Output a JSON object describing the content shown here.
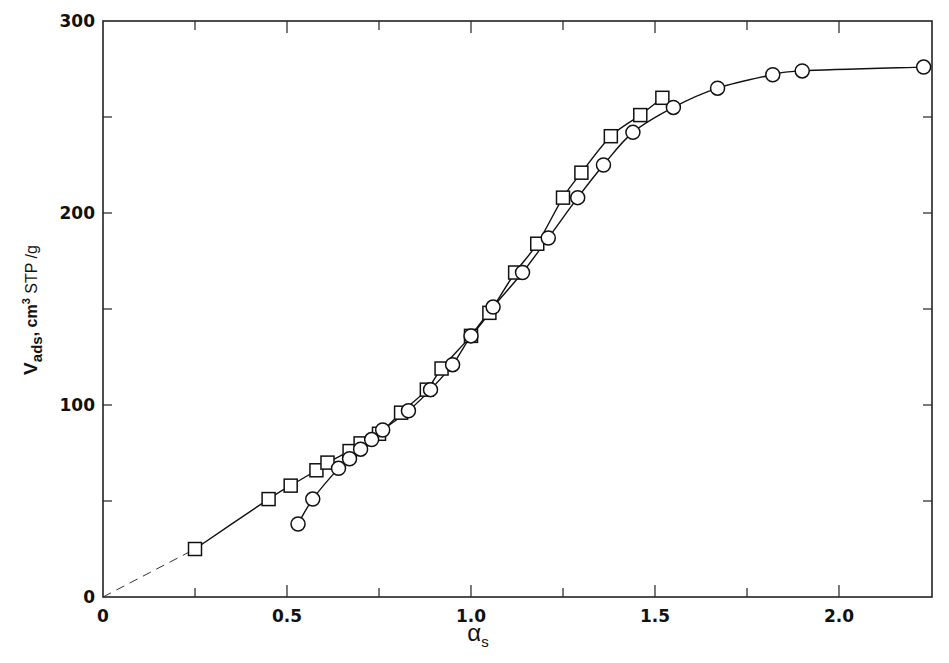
{
  "chart_data": {
    "type": "line",
    "title": "",
    "xlabel": "α",
    "xlabel_subscript": "s",
    "ylabel_main": "V",
    "ylabel_subscript": "ads",
    "ylabel_units_prefix": ",  cm",
    "ylabel_units_sup": "3",
    "ylabel_units_suffix": " STP /g",
    "xlim": [
      0,
      2.24
    ],
    "ylim": [
      0,
      300
    ],
    "grid": false,
    "legend": null,
    "x_ticks": [
      {
        "value": 0,
        "label": "0"
      },
      {
        "value": 0.25,
        "label": ""
      },
      {
        "value": 0.5,
        "label": "0.5"
      },
      {
        "value": 0.75,
        "label": ""
      },
      {
        "value": 1.0,
        "label": "1.0"
      },
      {
        "value": 1.25,
        "label": ""
      },
      {
        "value": 1.5,
        "label": "1.5"
      },
      {
        "value": 1.75,
        "label": ""
      },
      {
        "value": 2.0,
        "label": "2.0"
      }
    ],
    "y_ticks": [
      {
        "value": 0,
        "label": "0"
      },
      {
        "value": 50,
        "label": ""
      },
      {
        "value": 100,
        "label": "100"
      },
      {
        "value": 150,
        "label": ""
      },
      {
        "value": 200,
        "label": "200"
      },
      {
        "value": 250,
        "label": ""
      },
      {
        "value": 300,
        "label": "300"
      }
    ],
    "series": [
      {
        "name": "squares",
        "marker": "square",
        "x": [
          0.25,
          0.45,
          0.51,
          0.58,
          0.61,
          0.67,
          0.7,
          0.75,
          0.81,
          0.88,
          0.92,
          1.0,
          1.05,
          1.12,
          1.18,
          1.25,
          1.3,
          1.38,
          1.46,
          1.52
        ],
        "y": [
          25,
          51,
          58,
          66,
          70,
          76,
          80,
          85,
          96,
          108,
          119,
          136,
          148,
          169,
          184,
          208,
          221,
          240,
          251,
          260
        ]
      },
      {
        "name": "circles",
        "marker": "circle",
        "x": [
          0.53,
          0.57,
          0.64,
          0.67,
          0.7,
          0.73,
          0.76,
          0.83,
          0.89,
          0.95,
          1.0,
          1.06,
          1.14,
          1.21,
          1.29,
          1.36,
          1.44,
          1.55,
          1.67,
          1.82,
          1.9,
          2.23
        ],
        "y": [
          38,
          51,
          67,
          72,
          77,
          82,
          87,
          97,
          108,
          121,
          136,
          151,
          169,
          187,
          208,
          225,
          242,
          255,
          265,
          272,
          274,
          276
        ]
      }
    ],
    "extrapolation": {
      "style": "dashed",
      "from": [
        0,
        0
      ],
      "to": [
        0.25,
        25
      ]
    }
  }
}
